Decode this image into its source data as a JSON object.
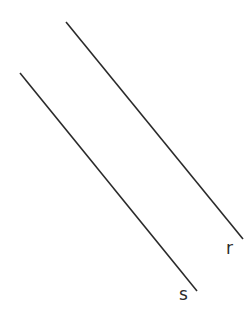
{
  "diagram": {
    "background": "#ffffff",
    "stroke_color": "#2a2a2a",
    "lines": [
      {
        "name": "r",
        "x1": 66,
        "y1": 22,
        "x2": 243,
        "y2": 239,
        "label": "r",
        "label_x": 226,
        "label_y": 254
      },
      {
        "name": "s",
        "x1": 20,
        "y1": 73,
        "x2": 197,
        "y2": 291,
        "label": "s",
        "label_x": 179,
        "label_y": 300
      }
    ]
  }
}
